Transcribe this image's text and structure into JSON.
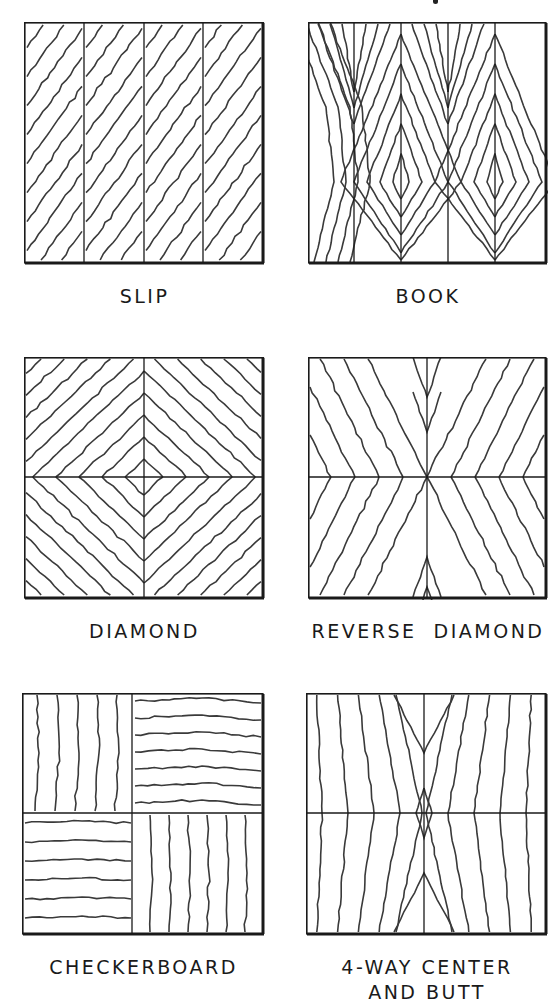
{
  "figure": {
    "stroke_color": "#2a2a2a",
    "background": "#ffffff"
  },
  "panels": [
    {
      "id": "slip",
      "label": "SLIP"
    },
    {
      "id": "book",
      "label": "BOOK"
    },
    {
      "id": "diamond",
      "label": "DIAMOND"
    },
    {
      "id": "reverse-diamond",
      "label": "REVERSE  DIAMOND"
    },
    {
      "id": "checkerboard",
      "label": "CHECKERBOARD"
    },
    {
      "id": "four-way",
      "label": "4-WAY CENTER\nAND BUTT"
    }
  ]
}
